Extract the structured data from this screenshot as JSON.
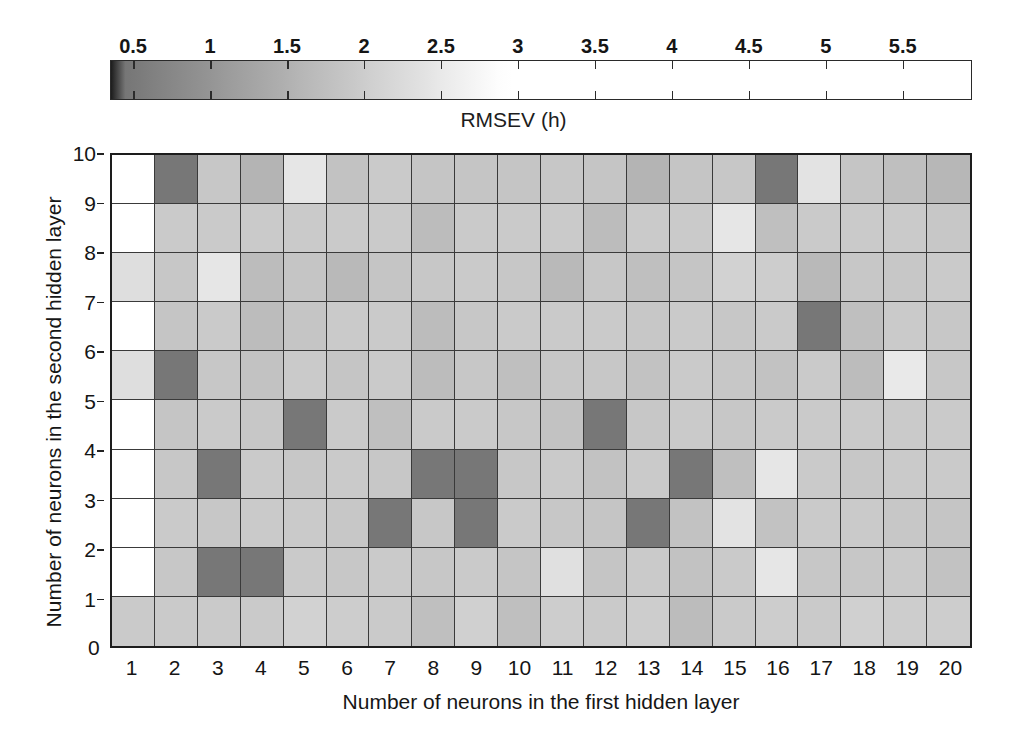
{
  "chart_data": {
    "type": "heatmap",
    "title": "RMSEV (h)",
    "xlabel": "Number of neurons in the first hidden layer",
    "ylabel": "Number of neurons in the second hidden layer",
    "grid": true,
    "legend_position": "top",
    "colorbar": {
      "label": "RMSEV (h)",
      "tick_labels": [
        "0.5",
        "1",
        "1.5",
        "2",
        "2.5",
        "3",
        "3.5",
        "4",
        "4.5",
        "5",
        "5.5"
      ],
      "tick_values": [
        0.5,
        1,
        1.5,
        2,
        2.5,
        3,
        3.5,
        4,
        4.5,
        5,
        5.5
      ],
      "range": [
        0.35,
        5.95
      ],
      "low_color": "#1c1c1c",
      "high_color": "#ffffff",
      "saturation_value": 2.9
    },
    "x": [
      1,
      2,
      3,
      4,
      5,
      6,
      7,
      8,
      9,
      10,
      11,
      12,
      13,
      14,
      15,
      16,
      17,
      18,
      19,
      20
    ],
    "y": [
      1,
      2,
      3,
      4,
      5,
      6,
      7,
      8,
      9,
      10
    ],
    "xtick_labels": [
      "1",
      "2",
      "3",
      "4",
      "5",
      "6",
      "7",
      "8",
      "9",
      "10",
      "11",
      "12",
      "13",
      "14",
      "15",
      "16",
      "17",
      "18",
      "19",
      "20"
    ],
    "ytick_labels": [
      "0",
      "1",
      "2",
      "3",
      "4",
      "5",
      "6",
      "7",
      "8",
      "9",
      "10"
    ],
    "xlim": [
      1,
      21
    ],
    "ylim": [
      0,
      10
    ],
    "rows_top_to_bottom": [
      {
        "y": 10,
        "values": [
          6.0,
          0.45,
          1.9,
          1.55,
          2.45,
          1.8,
          1.95,
          1.85,
          1.85,
          1.85,
          1.9,
          1.85,
          1.55,
          1.85,
          1.9,
          0.45,
          2.4,
          1.85,
          1.75,
          1.6
        ]
      },
      {
        "y": 9,
        "values": [
          6.0,
          1.95,
          1.95,
          1.95,
          1.95,
          1.95,
          1.95,
          1.7,
          1.95,
          1.95,
          1.95,
          1.7,
          1.95,
          1.95,
          2.45,
          1.75,
          1.95,
          1.95,
          1.95,
          1.9
        ]
      },
      {
        "y": 8,
        "values": [
          2.3,
          1.9,
          2.45,
          1.7,
          1.85,
          1.65,
          1.85,
          1.9,
          1.95,
          1.9,
          1.65,
          1.9,
          1.75,
          1.85,
          2.1,
          2.0,
          1.65,
          1.9,
          1.9,
          1.95
        ]
      },
      {
        "y": 7,
        "values": [
          6.0,
          1.85,
          1.95,
          1.7,
          1.85,
          1.95,
          1.95,
          1.7,
          1.9,
          1.95,
          1.95,
          1.95,
          1.9,
          1.95,
          1.9,
          1.95,
          0.45,
          1.75,
          1.95,
          1.9
        ]
      },
      {
        "y": 6,
        "values": [
          2.3,
          0.45,
          1.9,
          1.8,
          1.95,
          1.85,
          1.95,
          1.7,
          1.9,
          1.75,
          1.9,
          1.9,
          1.8,
          1.95,
          1.9,
          1.8,
          1.95,
          1.7,
          2.5,
          1.9
        ]
      },
      {
        "y": 5,
        "values": [
          6.0,
          1.85,
          1.95,
          1.9,
          0.45,
          1.95,
          1.75,
          1.95,
          1.95,
          1.9,
          1.8,
          0.45,
          1.9,
          1.95,
          1.9,
          1.95,
          1.95,
          1.95,
          1.95,
          1.95
        ]
      },
      {
        "y": 4,
        "values": [
          6.0,
          1.9,
          0.45,
          1.95,
          1.9,
          1.95,
          1.9,
          0.45,
          0.45,
          1.9,
          1.95,
          1.8,
          1.95,
          0.45,
          1.75,
          2.45,
          1.95,
          1.9,
          1.95,
          1.95
        ]
      },
      {
        "y": 3,
        "values": [
          6.0,
          1.95,
          1.9,
          1.95,
          1.95,
          1.9,
          0.45,
          1.9,
          0.45,
          1.95,
          1.9,
          1.85,
          0.45,
          1.8,
          2.4,
          1.8,
          1.95,
          1.95,
          1.9,
          1.85
        ]
      },
      {
        "y": 2,
        "values": [
          6.0,
          1.9,
          0.45,
          0.45,
          1.95,
          1.9,
          1.95,
          1.9,
          1.95,
          1.85,
          2.35,
          1.85,
          1.95,
          1.8,
          1.95,
          2.45,
          1.9,
          1.9,
          1.95,
          1.8
        ]
      },
      {
        "y": 1,
        "values": [
          1.95,
          1.95,
          1.95,
          1.95,
          2.1,
          2.0,
          1.95,
          1.75,
          2.05,
          1.75,
          2.0,
          1.95,
          2.0,
          1.7,
          1.95,
          2.0,
          1.95,
          2.05,
          2.0,
          2.0
        ]
      }
    ]
  },
  "colorbar_ui": {
    "title": "RMSEV (h)",
    "ticks": [
      "0.5",
      "1",
      "1.5",
      "2",
      "2.5",
      "3",
      "3.5",
      "4",
      "4.5",
      "5",
      "5.5"
    ]
  },
  "axes": {
    "x_title": "Number of neurons in the first hidden layer",
    "y_title": "Number of neurons in the second hidden layer",
    "x_ticks": [
      "1",
      "2",
      "3",
      "4",
      "5",
      "6",
      "7",
      "8",
      "9",
      "10",
      "11",
      "12",
      "13",
      "14",
      "15",
      "16",
      "17",
      "18",
      "19",
      "20"
    ],
    "y_ticks": [
      "0",
      "1",
      "2",
      "3",
      "4",
      "5",
      "6",
      "7",
      "8",
      "9",
      "10"
    ]
  }
}
